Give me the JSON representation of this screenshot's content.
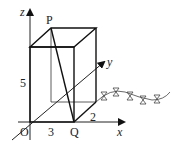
{
  "diagram": {
    "type": "3d-coordinate-box",
    "axes": {
      "x_label": "x",
      "y_label": "y",
      "z_label": "z"
    },
    "points": {
      "origin": "O",
      "P": "P",
      "Q": "Q"
    },
    "dimensions": {
      "length_x": "3",
      "width_y": "2",
      "height_z": "5"
    },
    "decoration": "bowtie-chain-curve"
  }
}
